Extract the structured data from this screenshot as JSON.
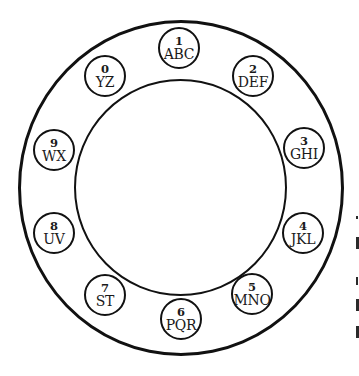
{
  "diagram": {
    "type": "rotary-phone-dial",
    "colors": {
      "stroke": "#111111",
      "background": "#ffffff",
      "text": "#1a1a1a"
    },
    "keys": [
      {
        "digit": "1",
        "letters": "ABC",
        "cx": 179,
        "cy": 48
      },
      {
        "digit": "2",
        "letters": "DEF",
        "cx": 253,
        "cy": 76
      },
      {
        "digit": "3",
        "letters": "GHI",
        "cx": 304,
        "cy": 148
      },
      {
        "digit": "4",
        "letters": "JKL",
        "cx": 303,
        "cy": 233
      },
      {
        "digit": "5",
        "letters": "MNO",
        "cx": 252,
        "cy": 294
      },
      {
        "digit": "6",
        "letters": "PQR",
        "cx": 181,
        "cy": 319
      },
      {
        "digit": "7",
        "letters": "ST",
        "cx": 105,
        "cy": 295
      },
      {
        "digit": "8",
        "letters": "UV",
        "cx": 54,
        "cy": 233
      },
      {
        "digit": "9",
        "letters": "WX",
        "cx": 54,
        "cy": 150
      },
      {
        "digit": "0",
        "letters": "YZ",
        "cx": 105,
        "cy": 76
      }
    ]
  }
}
